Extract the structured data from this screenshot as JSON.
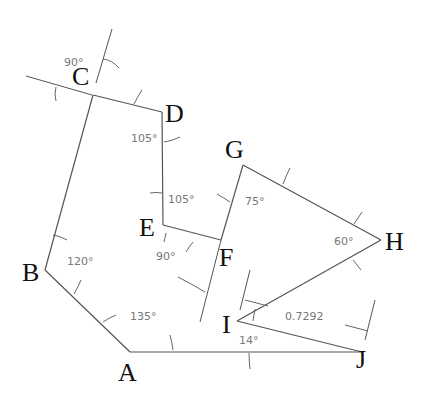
{
  "diagram": {
    "colors": {
      "line": "#555555",
      "vertex_label": "#111111",
      "angle_label": "#777777",
      "background": "#ffffff"
    },
    "vertices": [
      {
        "id": "A",
        "label": "A",
        "x": 130,
        "y": 352
      },
      {
        "id": "B",
        "label": "B",
        "x": 45,
        "y": 270
      },
      {
        "id": "C",
        "label": "C",
        "x": 93,
        "y": 95
      },
      {
        "id": "D",
        "label": "D",
        "x": 162,
        "y": 112
      },
      {
        "id": "E",
        "label": "E",
        "x": 163,
        "y": 225
      },
      {
        "id": "F",
        "label": "F",
        "x": 221,
        "y": 240
      },
      {
        "id": "G",
        "label": "G",
        "x": 243,
        "y": 165
      },
      {
        "id": "H",
        "label": "H",
        "x": 381,
        "y": 240
      },
      {
        "id": "I",
        "label": "I",
        "x": 237,
        "y": 321
      },
      {
        "id": "J",
        "label": "J",
        "x": 362,
        "y": 352
      }
    ],
    "angles": [
      {
        "at": "C",
        "label": "90°"
      },
      {
        "at": "D",
        "label": "105°"
      },
      {
        "at": "E",
        "label": "105°"
      },
      {
        "at": "F",
        "label": "90°"
      },
      {
        "at": "G",
        "label": "75°"
      },
      {
        "at": "H",
        "label": "60°"
      },
      {
        "at": "B",
        "label": "120°"
      },
      {
        "at": "A",
        "label": "135°"
      },
      {
        "at": "I",
        "label": "14°"
      }
    ],
    "dimension": {
      "between": [
        "I",
        "J"
      ],
      "label": "0.7292"
    }
  }
}
